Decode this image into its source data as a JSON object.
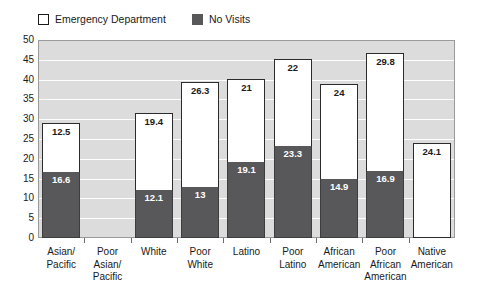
{
  "legend": {
    "position": "top-left",
    "entries": [
      {
        "label": "Emergency Department",
        "swatch": "white-box-icon",
        "color": "#ffffff"
      },
      {
        "label": "No Visits",
        "swatch": "dark-box-icon",
        "color": "#58585a"
      }
    ]
  },
  "chart_data": {
    "type": "bar",
    "subtype": "stacked",
    "title": "",
    "subtitle": "",
    "xlabel": "",
    "ylabel": "",
    "ylim": [
      0,
      50
    ],
    "yticks": [
      0,
      5,
      10,
      15,
      20,
      25,
      30,
      35,
      40,
      45,
      50
    ],
    "grid": true,
    "legend_position": "top-left",
    "categories": [
      "Asian/ Pacific",
      "Poor Asian/ Pacific",
      "White",
      "Poor White",
      "Latino",
      "Poor Latino",
      "African American",
      "Poor African American",
      "Native American"
    ],
    "category_lines": [
      [
        "Asian/",
        "Pacific"
      ],
      [
        "Poor",
        "Asian/",
        "Pacific"
      ],
      [
        "White"
      ],
      [
        "Poor",
        "White"
      ],
      [
        "Latino"
      ],
      [
        "Poor",
        "Latino"
      ],
      [
        "African",
        "American"
      ],
      [
        "Poor",
        "African",
        "American"
      ],
      [
        "Native",
        "American"
      ]
    ],
    "series": [
      {
        "name": "No Visits",
        "color": "#58585a",
        "values": [
          16.6,
          null,
          12.1,
          13,
          19.1,
          23.3,
          14.9,
          16.9,
          null
        ]
      },
      {
        "name": "Emergency Department",
        "color": "#ffffff",
        "values": [
          12.5,
          null,
          19.4,
          26.3,
          21,
          22,
          24,
          29.8,
          24.1
        ]
      }
    ],
    "totals": [
      29.1,
      null,
      31.5,
      39.3,
      40.1,
      45.3,
      38.9,
      46.7,
      24.1
    ]
  },
  "colors": {
    "plot_background": "#dcdcdc",
    "gridline": "#ffffff",
    "bar_no_visits": "#58585a",
    "bar_emergency": "#ffffff",
    "axis_text": "#1a1a1a",
    "page_background": "#ffffff"
  }
}
